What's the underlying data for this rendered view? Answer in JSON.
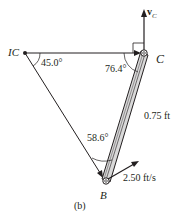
{
  "diagram": {
    "caption": "(b)",
    "points": {
      "ic": {
        "label": "IC"
      },
      "c": {
        "label": "C"
      },
      "b": {
        "label": "B"
      }
    },
    "velocity_c": {
      "symbol": "v",
      "subscript": "C"
    },
    "angles": {
      "at_ic": "45.0°",
      "at_c": "76.4°",
      "at_b": "58.6°"
    },
    "bar_length": "0.75 ft",
    "velocity_b": "2.50 ft/s",
    "colors": {
      "line": "#231f20",
      "bar_fill": "#d9d9d9"
    }
  }
}
